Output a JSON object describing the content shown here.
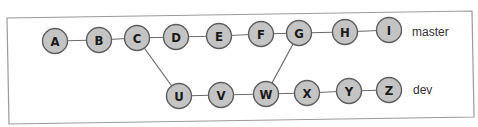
{
  "diagram": {
    "type": "git-branch-graph",
    "colors": {
      "node_fill": "#c4c4c4",
      "node_stroke": "#5e5e5e",
      "edge": "#6b6b6b",
      "frame": "#9a9a9a",
      "text": "#1a1a1a"
    },
    "branches": [
      {
        "name": "master",
        "label": "master",
        "commits": [
          "A",
          "B",
          "C",
          "D",
          "E",
          "F",
          "G",
          "H",
          "I"
        ]
      },
      {
        "name": "dev",
        "label": "dev",
        "commits": [
          "U",
          "V",
          "W",
          "X",
          "Y",
          "Z"
        ]
      }
    ],
    "nodes": {
      "A": "A",
      "B": "B",
      "C": "C",
      "D": "D",
      "E": "E",
      "F": "F",
      "G": "G",
      "H": "H",
      "I": "I",
      "U": "U",
      "V": "V",
      "W": "W",
      "X": "X",
      "Y": "Y",
      "Z": "Z"
    },
    "edges": [
      [
        "A",
        "B"
      ],
      [
        "B",
        "C"
      ],
      [
        "C",
        "D"
      ],
      [
        "D",
        "E"
      ],
      [
        "E",
        "F"
      ],
      [
        "F",
        "G"
      ],
      [
        "G",
        "H"
      ],
      [
        "H",
        "I"
      ],
      [
        "C",
        "U"
      ],
      [
        "U",
        "V"
      ],
      [
        "V",
        "W"
      ],
      [
        "W",
        "X"
      ],
      [
        "X",
        "Y"
      ],
      [
        "Y",
        "Z"
      ],
      [
        "W",
        "G"
      ]
    ],
    "labels": {
      "master": "master",
      "dev": "dev"
    }
  }
}
